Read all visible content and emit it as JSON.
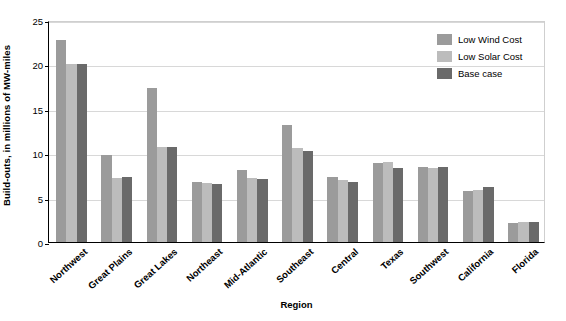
{
  "chart_data": {
    "type": "bar",
    "title": "",
    "subtitle": "",
    "xlabel": "Region",
    "ylabel": "Build-outs, in millions of MW-miles",
    "ylim": [
      0,
      25
    ],
    "yticks": [
      0,
      5,
      10,
      15,
      20,
      25
    ],
    "ytick_labels": [
      "0",
      "5",
      "10",
      "15",
      "20",
      "25"
    ],
    "grid": "horizontal",
    "legend_position": "top-right",
    "categories": [
      "Northwest",
      "Great Plains",
      "Great Lakes",
      "Northeast",
      "Mid-Atlantic",
      "Southeast",
      "Central",
      "Texas",
      "Southwest",
      "California",
      "Florida"
    ],
    "series": [
      {
        "name": "Low Wind Cost",
        "color": "#9b9b9b",
        "values": [
          22.7,
          9.8,
          17.3,
          6.8,
          8.1,
          13.2,
          7.3,
          8.9,
          8.4,
          5.7,
          2.1
        ]
      },
      {
        "name": "Low Solar Cost",
        "color": "#bcbcbc",
        "values": [
          20.0,
          7.2,
          10.7,
          6.6,
          7.2,
          10.6,
          7.0,
          9.0,
          8.3,
          5.9,
          2.2
        ]
      },
      {
        "name": "Base case",
        "color": "#6a6a6a",
        "values": [
          20.0,
          7.3,
          10.7,
          6.5,
          7.1,
          10.3,
          6.8,
          8.3,
          8.5,
          6.2,
          2.2
        ]
      }
    ]
  },
  "axes": {
    "y_title": "Build-outs, in millions of MW-miles",
    "x_title": "Region"
  },
  "legend": {
    "items": [
      {
        "label": "Low Wind Cost",
        "color": "#9b9b9b"
      },
      {
        "label": "Low Solar Cost",
        "color": "#bcbcbc"
      },
      {
        "label": "Base case",
        "color": "#6a6a6a"
      }
    ]
  },
  "colors": {
    "low_wind_cost": "#9b9b9b",
    "low_solar_cost": "#bcbcbc",
    "base_case": "#6a6a6a",
    "axis": "#000000",
    "gridline": "#d8d8d8",
    "background": "#ffffff"
  }
}
